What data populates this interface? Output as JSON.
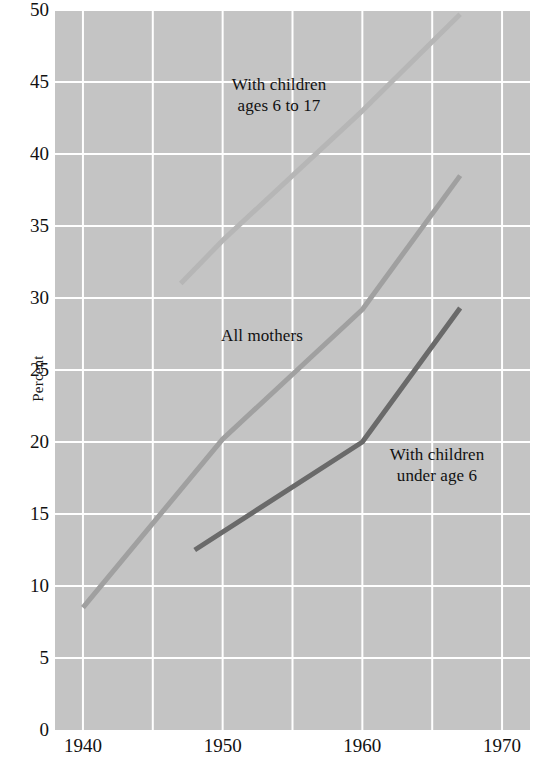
{
  "chart_data": {
    "type": "line",
    "title": "",
    "subtitle": "",
    "xlabel": "",
    "ylabel": "Percent",
    "xlim": [
      1938,
      1972
    ],
    "ylim": [
      0,
      50
    ],
    "xticks": [
      1940,
      1950,
      1960,
      1970
    ],
    "yticks": [
      0,
      5,
      10,
      15,
      20,
      25,
      30,
      35,
      40,
      45,
      50
    ],
    "xtick_labels": [
      "1940",
      "1950",
      "1960",
      "1970"
    ],
    "ytick_labels": [
      "0",
      "5",
      "10",
      "15",
      "20",
      "25",
      "30",
      "35",
      "40",
      "45",
      "50"
    ],
    "x_minor_gridlines": [
      1940,
      1945,
      1950,
      1955,
      1960,
      1965,
      1970
    ],
    "grid": true,
    "grid_color": "#ffffff",
    "plot_background": "#c4c4c4",
    "legend": "inline-annotations",
    "series": [
      {
        "name": "With children ages 6 to 17",
        "color": "#b6b6b6",
        "x": [
          1947,
          1950,
          1955,
          1960,
          1965,
          1967
        ],
        "values": [
          31.0,
          34.0,
          38.5,
          43.0,
          47.8,
          49.7
        ]
      },
      {
        "name": "All mothers",
        "color": "#a0a0a0",
        "x": [
          1940,
          1950,
          1960,
          1967
        ],
        "values": [
          8.5,
          20.2,
          29.2,
          38.5
        ]
      },
      {
        "name": "With children under age 6",
        "color": "#6a6a6a",
        "x": [
          1948,
          1960,
          1967
        ],
        "values": [
          12.5,
          20.0,
          29.3
        ]
      }
    ],
    "annotations": [
      {
        "id": "ages-6-to-17",
        "lines": "With children\nages 6 to 17",
        "x_px": 279,
        "y_px": 96
      },
      {
        "id": "all-mothers",
        "lines": "All mothers",
        "x_px": 262,
        "y_px": 336
      },
      {
        "id": "under-age-6",
        "lines": "With children\nunder age 6",
        "x_px": 437,
        "y_px": 466
      }
    ]
  }
}
